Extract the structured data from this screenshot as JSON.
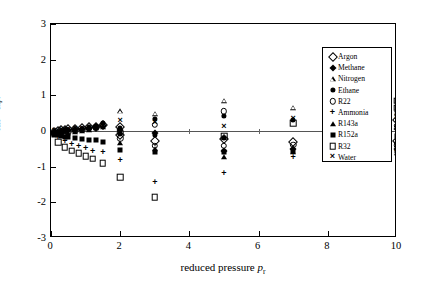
{
  "axes": {
    "x_title_prefix": "reduced pressure ",
    "x_title_symbol": "p",
    "x_title_sub": "r",
    "y_title": "100(1-Z_calc/Z_expt)",
    "x_ticks": [
      "0",
      "2",
      "4",
      "6",
      "8",
      "10"
    ],
    "y_ticks": [
      "3",
      "2",
      "1",
      "0",
      "-1",
      "-2",
      "-3"
    ]
  },
  "legend": {
    "entries": [
      {
        "label": "Argon",
        "marker": "open-diamond",
        "glyph": ""
      },
      {
        "label": "Methane",
        "marker": "filled-diamond",
        "glyph": ""
      },
      {
        "label": "Nitrogen",
        "marker": "open-triangle",
        "glyph": ""
      },
      {
        "label": "Ethane",
        "marker": "filled-circle",
        "glyph": ""
      },
      {
        "label": "R22",
        "marker": "open-circle",
        "glyph": ""
      },
      {
        "label": "Ammonia",
        "marker": "plus",
        "glyph": "+"
      },
      {
        "label": "R143a",
        "marker": "filled-triangle",
        "glyph": ""
      },
      {
        "label": "R152a",
        "marker": "filled-square",
        "glyph": ""
      },
      {
        "label": "R32",
        "marker": "open-square",
        "glyph": ""
      },
      {
        "label": "Water",
        "marker": "cross",
        "glyph": "×"
      }
    ]
  },
  "chart_data": {
    "type": "scatter",
    "title": "",
    "xlabel": "reduced pressure p_r",
    "ylabel": "100(1-Z_calc/Z_expt)",
    "xlim": [
      0,
      10
    ],
    "ylim": [
      -3,
      3
    ],
    "xticks": [
      0,
      2,
      4,
      6,
      8,
      10
    ],
    "yticks": [
      -3,
      -2,
      -1,
      0,
      1,
      2,
      3
    ],
    "grid": false,
    "legend_position": "upper-right-inside",
    "zero_reference_line": 0,
    "series": [
      {
        "name": "Argon",
        "marker": "open-diamond",
        "points": [
          [
            0.1,
            -0.02
          ],
          [
            0.2,
            0.0
          ],
          [
            0.3,
            0.02
          ],
          [
            0.4,
            0.03
          ],
          [
            0.5,
            0.05
          ],
          [
            0.7,
            0.06
          ],
          [
            0.9,
            0.08
          ],
          [
            1.1,
            0.1
          ],
          [
            1.3,
            0.12
          ],
          [
            1.5,
            0.18
          ],
          [
            2.0,
            0.1
          ],
          [
            2.0,
            -0.1
          ],
          [
            3.0,
            -0.28
          ],
          [
            5.0,
            -0.22
          ],
          [
            7.0,
            -0.3
          ],
          [
            10.0,
            -0.28
          ],
          [
            10.0,
            0.3
          ]
        ]
      },
      {
        "name": "Methane",
        "marker": "filled-diamond",
        "points": [
          [
            0.1,
            -0.03
          ],
          [
            0.2,
            -0.02
          ],
          [
            0.3,
            0.0
          ],
          [
            0.4,
            0.02
          ],
          [
            0.5,
            0.04
          ],
          [
            0.7,
            0.05
          ],
          [
            0.9,
            0.06
          ],
          [
            1.1,
            0.08
          ],
          [
            1.3,
            0.1
          ],
          [
            1.5,
            0.14
          ],
          [
            2.0,
            0.02
          ],
          [
            3.0,
            -0.05
          ],
          [
            5.0,
            -0.55
          ],
          [
            7.0,
            -0.5
          ],
          [
            10.0,
            -0.5
          ],
          [
            10.0,
            0.05
          ]
        ]
      },
      {
        "name": "Nitrogen",
        "marker": "open-triangle",
        "points": [
          [
            0.1,
            -0.04
          ],
          [
            0.3,
            -0.02
          ],
          [
            0.5,
            0.0
          ],
          [
            0.7,
            0.02
          ],
          [
            0.9,
            0.05
          ],
          [
            1.1,
            0.08
          ],
          [
            1.3,
            0.12
          ],
          [
            1.5,
            0.2
          ],
          [
            2.0,
            0.55
          ],
          [
            3.0,
            0.48
          ],
          [
            5.0,
            0.85
          ],
          [
            7.0,
            0.65
          ],
          [
            10.0,
            0.6
          ]
        ]
      },
      {
        "name": "Ethane",
        "marker": "filled-circle",
        "points": [
          [
            0.1,
            -0.05
          ],
          [
            0.2,
            -0.03
          ],
          [
            0.3,
            -0.02
          ],
          [
            0.4,
            0.0
          ],
          [
            0.5,
            0.02
          ],
          [
            0.7,
            0.04
          ],
          [
            0.9,
            0.06
          ],
          [
            1.1,
            0.1
          ],
          [
            1.3,
            0.15
          ],
          [
            1.5,
            0.22
          ],
          [
            2.0,
            0.08
          ],
          [
            2.0,
            -0.08
          ],
          [
            3.0,
            0.35
          ],
          [
            3.0,
            -0.12
          ],
          [
            5.0,
            0.42
          ],
          [
            5.0,
            -0.2
          ],
          [
            7.0,
            0.3
          ],
          [
            10.0,
            0.45
          ],
          [
            10.0,
            -0.35
          ]
        ]
      },
      {
        "name": "R22",
        "marker": "open-circle",
        "points": [
          [
            0.1,
            -0.06
          ],
          [
            0.3,
            -0.04
          ],
          [
            0.5,
            -0.02
          ],
          [
            0.7,
            0.0
          ],
          [
            0.9,
            0.03
          ],
          [
            1.1,
            0.06
          ],
          [
            1.3,
            0.1
          ],
          [
            1.5,
            0.16
          ],
          [
            2.0,
            -0.04
          ],
          [
            2.0,
            -0.2
          ],
          [
            3.0,
            0.18
          ],
          [
            3.0,
            -0.42
          ],
          [
            5.0,
            0.55
          ],
          [
            5.0,
            -0.42
          ],
          [
            7.0,
            -0.38
          ],
          [
            10.0,
            -0.4
          ],
          [
            10.0,
            0.15
          ]
        ]
      },
      {
        "name": "Ammonia",
        "marker": "plus",
        "points": [
          [
            0.2,
            -0.2
          ],
          [
            0.4,
            -0.3
          ],
          [
            0.6,
            -0.38
          ],
          [
            0.8,
            -0.45
          ],
          [
            1.0,
            -0.5
          ],
          [
            1.2,
            -0.58
          ],
          [
            1.5,
            -0.62
          ],
          [
            2.0,
            -0.85
          ],
          [
            3.0,
            -1.45
          ],
          [
            5.0,
            -1.2
          ],
          [
            7.0,
            -0.75
          ],
          [
            10.0,
            -0.6
          ]
        ]
      },
      {
        "name": "R143a",
        "marker": "filled-triangle",
        "points": [
          [
            0.1,
            -0.08
          ],
          [
            0.3,
            -0.06
          ],
          [
            0.5,
            -0.05
          ],
          [
            0.7,
            -0.02
          ],
          [
            0.9,
            0.0
          ],
          [
            1.1,
            0.04
          ],
          [
            1.3,
            0.08
          ],
          [
            1.5,
            0.12
          ],
          [
            2.0,
            -0.35
          ],
          [
            3.0,
            -0.5
          ],
          [
            5.0,
            -0.72
          ],
          [
            7.0,
            -0.6
          ],
          [
            10.0,
            -0.62
          ]
        ]
      },
      {
        "name": "R152a",
        "marker": "filled-square",
        "points": [
          [
            0.1,
            -0.1
          ],
          [
            0.2,
            -0.12
          ],
          [
            0.3,
            -0.15
          ],
          [
            0.4,
            -0.16
          ],
          [
            0.5,
            -0.18
          ],
          [
            0.7,
            -0.2
          ],
          [
            0.9,
            -0.22
          ],
          [
            1.1,
            -0.24
          ],
          [
            1.3,
            -0.26
          ],
          [
            1.5,
            -0.3
          ],
          [
            2.0,
            -0.52
          ],
          [
            3.0,
            -0.6
          ],
          [
            5.0,
            -0.58
          ],
          [
            7.0,
            -0.55
          ],
          [
            10.0,
            -0.55
          ],
          [
            10.0,
            -0.15
          ]
        ]
      },
      {
        "name": "R32",
        "marker": "open-square",
        "points": [
          [
            0.2,
            -0.32
          ],
          [
            0.4,
            -0.45
          ],
          [
            0.6,
            -0.55
          ],
          [
            0.8,
            -0.62
          ],
          [
            1.0,
            -0.7
          ],
          [
            1.2,
            -0.78
          ],
          [
            1.5,
            -0.9
          ],
          [
            2.0,
            -1.3
          ],
          [
            3.0,
            -1.85
          ],
          [
            5.0,
            -0.15
          ],
          [
            7.0,
            0.22
          ],
          [
            10.0,
            0.85
          ],
          [
            10.0,
            0.65
          ]
        ]
      },
      {
        "name": "Water",
        "marker": "cross",
        "points": [
          [
            0.1,
            0.0
          ],
          [
            0.3,
            0.02
          ],
          [
            0.5,
            0.04
          ],
          [
            0.7,
            0.05
          ],
          [
            0.9,
            0.06
          ],
          [
            1.1,
            0.07
          ],
          [
            1.3,
            0.08
          ],
          [
            1.5,
            0.1
          ],
          [
            2.0,
            0.28
          ],
          [
            3.0,
            0.22
          ],
          [
            5.0,
            0.1
          ],
          [
            7.0,
            0.35
          ],
          [
            10.0,
            0.4
          ]
        ]
      }
    ]
  }
}
